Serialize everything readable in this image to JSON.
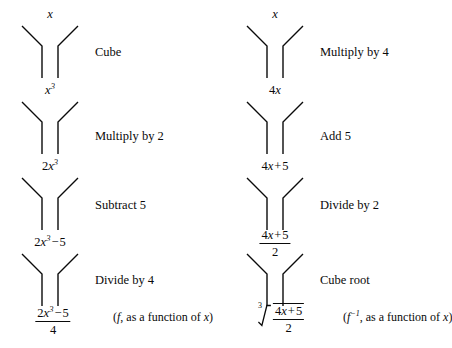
{
  "diagram": {
    "type": "function-machine-flowchart",
    "stroke_color": "#0a0a0a",
    "background_color": "#ffffff",
    "columns": [
      {
        "id": "forward",
        "name": "forward-function-column",
        "annotation": "(f, as a function of x)",
        "annotation_symbol": "f",
        "expressions": [
          {
            "id": "e0",
            "text": "x",
            "latex": "x"
          },
          {
            "id": "e1",
            "text": "x^3",
            "latex": "x^3"
          },
          {
            "id": "e2",
            "text": "2x^3",
            "latex": "2x^3"
          },
          {
            "id": "e3",
            "text": "2x^3 - 5",
            "latex": "2x^3-5"
          },
          {
            "id": "e4",
            "text": "(2x^3 - 5)/4",
            "latex": "\\frac{2x^3-5}{4}",
            "numerator": "2x^3 - 5",
            "denominator": "4"
          }
        ],
        "steps": [
          {
            "id": "s0",
            "label": "Cube"
          },
          {
            "id": "s1",
            "label": "Multiply by 2"
          },
          {
            "id": "s2",
            "label": "Subtract 5"
          },
          {
            "id": "s3",
            "label": "Divide by 4"
          }
        ]
      },
      {
        "id": "inverse",
        "name": "inverse-function-column",
        "annotation": "(f⁻¹, as a function of x)",
        "annotation_symbol": "f",
        "annotation_exponent": "−1",
        "expressions": [
          {
            "id": "e0",
            "text": "x",
            "latex": "x"
          },
          {
            "id": "e1",
            "text": "4x",
            "latex": "4x"
          },
          {
            "id": "e2",
            "text": "4x + 5",
            "latex": "4x+5"
          },
          {
            "id": "e3",
            "text": "(4x + 5)/2",
            "latex": "\\frac{4x+5}{2}",
            "numerator": "4x + 5",
            "denominator": "2"
          },
          {
            "id": "e4",
            "text": "cbrt((4x + 5)/2)",
            "latex": "\\sqrt[3]{\\frac{4x+5}{2}}",
            "index": "3",
            "numerator": "4x + 5",
            "denominator": "2"
          }
        ],
        "steps": [
          {
            "id": "s0",
            "label": "Multiply by 4"
          },
          {
            "id": "s1",
            "label": "Add 5"
          },
          {
            "id": "s2",
            "label": "Divide by 2"
          },
          {
            "id": "s3",
            "label": "Cube root"
          }
        ]
      }
    ],
    "glyphs": {
      "minus": "−",
      "plus": "+",
      "radical_index_left": "3",
      "radical_index_right": "3"
    },
    "text": {
      "x": "x",
      "two": "2",
      "three": "3",
      "four": "4",
      "five": "5",
      "annot_left": ", as a function of ",
      "annot_open": "(",
      "annot_close": ")",
      "annot_var": "x"
    }
  }
}
